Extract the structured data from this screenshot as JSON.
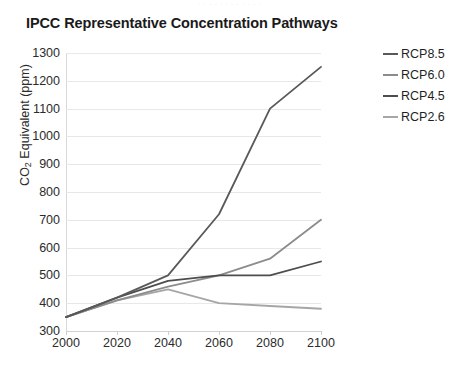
{
  "top_crop_text": "· · · · · · · · · · · ·",
  "chart_data": {
    "type": "line",
    "title": "IPCC Representative Concentration Pathways",
    "xlabel": "",
    "ylabel": "CO2 Equivalent (ppm)",
    "ylabel_main": "CO",
    "ylabel_sub": "2",
    "ylabel_rest": " Equivalent (ppm)",
    "x": [
      2000,
      2020,
      2040,
      2060,
      2080,
      2100
    ],
    "xlim": [
      2000,
      2100
    ],
    "ylim": [
      300,
      1300
    ],
    "xticks": [
      "2000",
      "2020",
      "2040",
      "2060",
      "2080",
      "2100"
    ],
    "yticks": [
      "300",
      "400",
      "500",
      "600",
      "700",
      "800",
      "900",
      "1000",
      "1100",
      "1200",
      "1300"
    ],
    "grid": true,
    "legend_position": "right",
    "series": [
      {
        "name": "RCP8.5",
        "color": "#595959",
        "values": [
          350,
          420,
          500,
          720,
          1100,
          1250
        ]
      },
      {
        "name": "RCP6.0",
        "color": "#8c8c8c",
        "values": [
          350,
          410,
          460,
          500,
          560,
          700
        ]
      },
      {
        "name": "RCP4.5",
        "color": "#4d4d4d",
        "values": [
          350,
          420,
          480,
          500,
          500,
          550
        ]
      },
      {
        "name": "RCP2.6",
        "color": "#a6a6a6",
        "values": [
          350,
          410,
          450,
          400,
          390,
          380
        ]
      }
    ]
  },
  "legend": {
    "items": [
      {
        "label": "RCP8.5",
        "color": "#595959"
      },
      {
        "label": "RCP6.0",
        "color": "#8c8c8c"
      },
      {
        "label": "RCP4.5",
        "color": "#4d4d4d"
      },
      {
        "label": "RCP2.6",
        "color": "#a6a6a6"
      }
    ]
  }
}
